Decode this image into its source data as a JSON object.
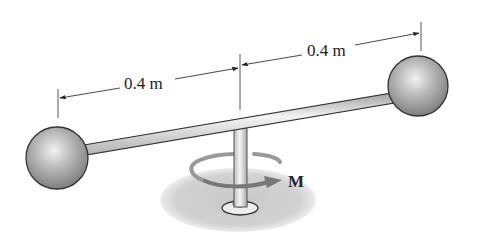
{
  "figure": {
    "type": "engineering-statics-diagram",
    "dimensions": [
      {
        "label": "0.4 m",
        "from": "left-sphere-center",
        "to": "shaft-axis"
      },
      {
        "label": "0.4 m",
        "from": "shaft-axis",
        "to": "right-sphere-center"
      }
    ],
    "moment_label": "M",
    "colors": {
      "sphere": "#9a9a9a",
      "rod": "#d8d8d8",
      "outline": "#333333",
      "shadow": "#cfcfcf",
      "text": "#222222"
    }
  }
}
